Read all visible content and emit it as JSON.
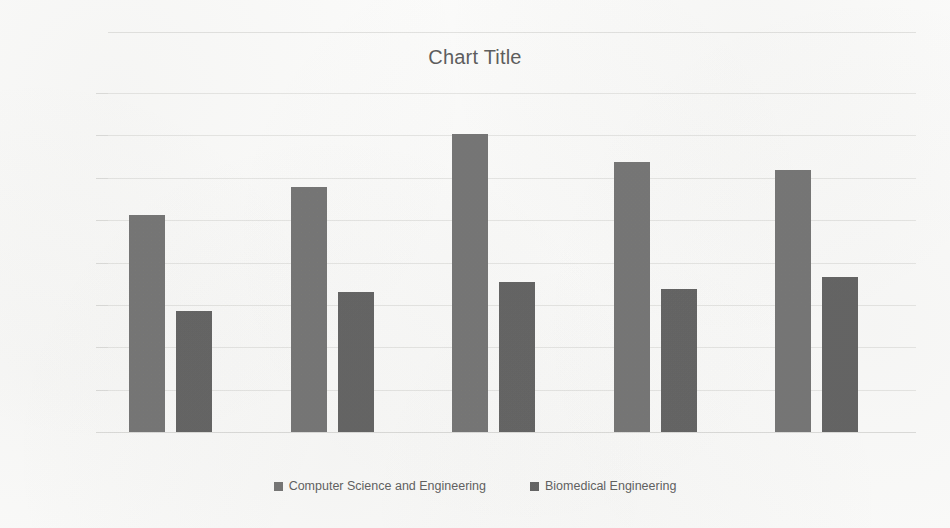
{
  "chart_data": {
    "type": "bar",
    "title": "Chart Title",
    "xlabel": "",
    "ylabel": "",
    "categories": [
      "2015",
      "2016",
      "2017",
      "2018",
      "2019"
    ],
    "series": [
      {
        "name": "Computer Science and Engineering",
        "color": "#757575",
        "values": [
          256,
          289,
          352,
          319,
          309
        ]
      },
      {
        "name": "Biomedical Engineering",
        "color": "#636363",
        "values": [
          143,
          165,
          177,
          169,
          183
        ]
      }
    ],
    "ylim": [
      0,
      400
    ],
    "ytick_step": 50,
    "yticks": [
      "400",
      "350",
      "300",
      "250",
      "200",
      "150",
      "100",
      "50",
      "0"
    ],
    "grid": true,
    "legend_position": "bottom"
  }
}
